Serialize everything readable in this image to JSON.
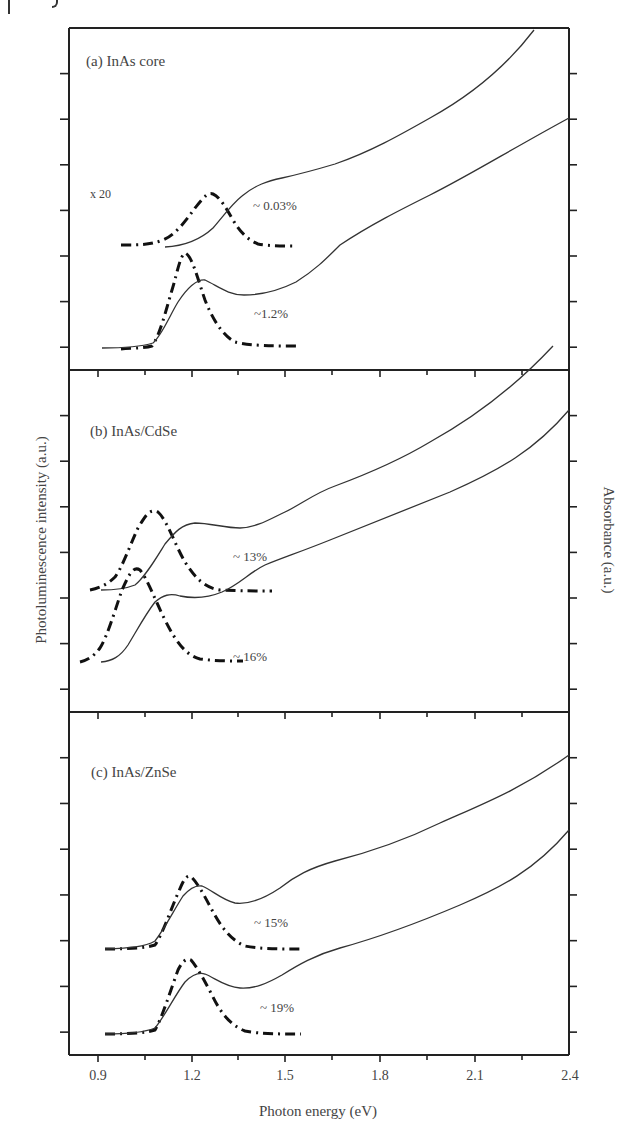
{
  "figure": {
    "ylabel_left": "Photoluminescence intensity (a.u.)",
    "ylabel_right": "Absorbance (a.u.)",
    "xlabel": "Photon energy (eV)",
    "xticks": [
      "0.9",
      "1.2",
      "1.5",
      "1.8",
      "2.1",
      "2.4"
    ],
    "panels": [
      {
        "label": "(a) InAs core",
        "scale_note": "x 20",
        "qy_upper": "~ 0.03%",
        "qy_lower": "~1.2%"
      },
      {
        "label": "(b) InAs/CdSe",
        "qy_upper": "~ 13%",
        "qy_lower": "~ 16%"
      },
      {
        "label": "(c) InAs/ZnSe",
        "qy_upper": "~ 15%",
        "qy_lower": "~ 19%"
      }
    ]
  },
  "chart_data": {
    "type": "line",
    "title": "",
    "xlabel": "Photon energy (eV)",
    "ylabel": "Photoluminescence intensity (a.u.)",
    "ylabel_right": "Absorbance (a.u.)",
    "xlim": [
      0.85,
      2.4
    ],
    "xticks": [
      0.9,
      1.2,
      1.5,
      1.8,
      2.1,
      2.4
    ],
    "grid": false,
    "line_styles": {
      "photoluminescence": "dash-dot (thick)",
      "absorbance": "solid (thin)"
    },
    "panels": [
      {
        "name": "(a) InAs core",
        "annotations": [
          "x 20",
          "~ 0.03%",
          "~1.2%"
        ],
        "series": [
          {
            "name": "PL upper (x20, QY ~0.03%)",
            "style": "dash-dot",
            "x": [
              0.97,
              1.1,
              1.2,
              1.26,
              1.32,
              1.4,
              1.52
            ],
            "y": [
              0,
              0.05,
              0.6,
              0.85,
              0.5,
              0.05,
              0
            ]
          },
          {
            "name": "Absorbance upper",
            "style": "solid",
            "x": [
              1.1,
              1.2,
              1.3,
              1.4,
              1.6,
              1.8,
              2.0,
              2.26
            ],
            "y": [
              0,
              0.15,
              0.6,
              0.95,
              1.15,
              1.55,
              2.2,
              3.4
            ]
          },
          {
            "name": "PL lower (QY ~1.2%)",
            "style": "dash-dot",
            "x": [
              0.93,
              1.07,
              1.14,
              1.19,
              1.24,
              1.32,
              1.4,
              1.53
            ],
            "y": [
              0,
              0.05,
              0.6,
              1.0,
              0.7,
              0.2,
              0.02,
              0
            ]
          },
          {
            "name": "Absorbance lower",
            "style": "solid",
            "x": [
              0.93,
              1.07,
              1.18,
              1.25,
              1.38,
              1.55,
              1.8,
              2.1,
              2.4
            ],
            "y": [
              0,
              0.05,
              0.5,
              0.75,
              0.55,
              0.8,
              1.4,
              2.4,
              3.9
            ]
          }
        ]
      },
      {
        "name": "(b) InAs/CdSe",
        "annotations": [
          "~ 13%",
          "~ 16%"
        ],
        "series": [
          {
            "name": "PL upper (QY ~13%)",
            "style": "dash-dot",
            "x": [
              0.89,
              0.98,
              1.05,
              1.1,
              1.16,
              1.24,
              1.34,
              1.46
            ],
            "y": [
              0,
              0.15,
              0.6,
              0.85,
              0.6,
              0.15,
              0,
              0
            ]
          },
          {
            "name": "Absorbance upper",
            "style": "solid",
            "x": [
              0.92,
              1.0,
              1.1,
              1.2,
              1.35,
              1.5,
              1.7,
              2.0,
              2.3
            ],
            "y": [
              0,
              0.02,
              0.35,
              0.75,
              0.72,
              1.1,
              1.45,
              2.0,
              3.3
            ]
          },
          {
            "name": "PL lower (QY ~16%)",
            "style": "dash-dot",
            "x": [
              0.87,
              0.95,
              1.02,
              1.06,
              1.11,
              1.18,
              1.3,
              1.46
            ],
            "y": [
              0,
              0.15,
              0.65,
              0.9,
              0.65,
              0.2,
              0,
              0
            ]
          },
          {
            "name": "Absorbance lower",
            "style": "solid",
            "x": [
              0.92,
              1.0,
              1.1,
              1.16,
              1.3,
              1.45,
              1.6,
              1.9,
              2.2,
              2.4
            ],
            "y": [
              0,
              0.05,
              0.45,
              0.62,
              0.6,
              0.95,
              1.15,
              1.55,
              2.3,
              3.5
            ]
          }
        ]
      },
      {
        "name": "(c) InAs/ZnSe",
        "annotations": [
          "~ 15%",
          "~ 19%"
        ],
        "series": [
          {
            "name": "PL upper (QY ~15%)",
            "style": "dash-dot",
            "x": [
              0.92,
              1.07,
              1.14,
              1.19,
              1.25,
              1.33,
              1.42,
              1.55
            ],
            "y": [
              0,
              0.05,
              0.6,
              0.85,
              0.6,
              0.15,
              0.02,
              0
            ]
          },
          {
            "name": "Absorbance upper",
            "style": "solid",
            "x": [
              0.92,
              1.07,
              1.16,
              1.24,
              1.38,
              1.55,
              1.7,
              2.0,
              2.4
            ],
            "y": [
              0,
              0.05,
              0.5,
              0.75,
              0.5,
              0.8,
              1.3,
              1.7,
              3.4
            ]
          },
          {
            "name": "PL lower (QY ~19%)",
            "style": "dash-dot",
            "x": [
              0.92,
              1.07,
              1.14,
              1.2,
              1.26,
              1.34,
              1.42,
              1.55
            ],
            "y": [
              0,
              0.05,
              0.6,
              0.85,
              0.55,
              0.15,
              0.02,
              0
            ]
          },
          {
            "name": "Absorbance lower",
            "style": "solid",
            "x": [
              0.92,
              1.07,
              1.17,
              1.25,
              1.38,
              1.55,
              1.7,
              2.0,
              2.4
            ],
            "y": [
              0,
              0.05,
              0.5,
              0.75,
              0.5,
              0.75,
              1.1,
              1.6,
              2.9
            ]
          }
        ]
      }
    ]
  }
}
